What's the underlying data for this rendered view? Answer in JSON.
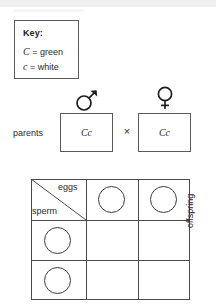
{
  "diagram": {
    "type": "punnett-square",
    "key": {
      "title": "Key:",
      "entries": [
        {
          "symbol": "C",
          "equals": "=",
          "meaning": "green",
          "text": "C = green"
        },
        {
          "symbol": "c",
          "equals": "=",
          "meaning": "white",
          "text": "c = white"
        }
      ]
    },
    "parents": {
      "label": "parents",
      "cross_symbol": "×",
      "male": {
        "sex_symbol_name": "male-symbol",
        "sex_symbol_glyph": "♂",
        "genotype": "Cc"
      },
      "female": {
        "sex_symbol_name": "female-symbol",
        "sex_symbol_glyph": "♀",
        "genotype": "Cc"
      }
    },
    "grid": {
      "column_axis_label": "eggs",
      "row_axis_label": "sperm",
      "side_label": "offspring",
      "columns": 2,
      "rows": 2,
      "header_gametes_top": [
        "",
        ""
      ],
      "header_gametes_left": [
        "",
        ""
      ],
      "cells": [
        [
          "",
          ""
        ],
        [
          "",
          ""
        ]
      ]
    },
    "colors": {
      "line": "#4a4a4a",
      "box_border": "#5a5a5a",
      "text": "#2a2a2a",
      "background": "#ffffff"
    }
  }
}
